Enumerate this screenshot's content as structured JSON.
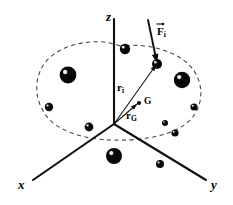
{
  "figure": {
    "background_color": "#ffffff",
    "ink_color": "#080808",
    "dashed_outline_color": "#444444",
    "width": 233,
    "height": 205
  },
  "axes": {
    "origin": {
      "x": 114,
      "y": 124
    },
    "items": [
      {
        "id": "z",
        "label": "z",
        "label_x": 106,
        "label_y": 10,
        "x1": 114,
        "y1": 124,
        "x2": 114,
        "y2": 19
      },
      {
        "id": "x",
        "label": "x",
        "label_x": 18,
        "label_y": 178,
        "x1": 114,
        "y1": 124,
        "x2": 33,
        "y2": 180
      },
      {
        "id": "y",
        "label": "y",
        "label_x": 211,
        "label_y": 178,
        "x1": 114,
        "y1": 124,
        "x2": 206,
        "y2": 180
      }
    ]
  },
  "vectors": [
    {
      "id": "r_i",
      "base": "r",
      "subscript": "i",
      "has_arrow_overbar": false,
      "label_x": 117,
      "label_y": 82,
      "x1": 114,
      "y1": 124,
      "x2": 156,
      "y2": 65,
      "description": "position vector from origin to particle i"
    },
    {
      "id": "r_G",
      "base": "r",
      "subscript": "G",
      "has_arrow_overbar": false,
      "label_x": 126,
      "label_y": 110,
      "x1": 114,
      "y1": 124,
      "x2": 137,
      "y2": 104,
      "description": "position vector from origin to center of mass G"
    },
    {
      "id": "F_i",
      "base": "F",
      "subscript": "i",
      "has_arrow_overbar": true,
      "label_x": 157,
      "label_y": 26,
      "x1": 148,
      "y1": 20,
      "x2": 157,
      "y2": 63,
      "description": "external force applied on particle i"
    }
  ],
  "points": [
    {
      "id": "G",
      "label": "G",
      "cx": 139,
      "cy": 103,
      "r": 2.0,
      "label_x": 144,
      "label_y": 97,
      "description": "center of mass"
    }
  ],
  "particles": [
    {
      "cx": 125,
      "cy": 49,
      "r": 5.2
    },
    {
      "cx": 68,
      "cy": 75,
      "r": 8.4
    },
    {
      "cx": 49,
      "cy": 107,
      "r": 4.2
    },
    {
      "cx": 89,
      "cy": 127,
      "r": 4.4
    },
    {
      "cx": 157,
      "cy": 64,
      "r": 5.0
    },
    {
      "cx": 182,
      "cy": 80,
      "r": 8.2
    },
    {
      "cx": 194,
      "cy": 107,
      "r": 3.6
    },
    {
      "cx": 165,
      "cy": 123,
      "r": 3.0
    },
    {
      "cx": 175,
      "cy": 133,
      "r": 3.6
    },
    {
      "cx": 114,
      "cy": 156,
      "r": 8.0
    },
    {
      "cx": 160,
      "cy": 164,
      "r": 4.0
    }
  ],
  "cloud_outline": {
    "path": "M 120 46 C 96 36 58 44 44 64 C 32 82 36 104 48 118 C 62 134 92 140 112 140 C 142 141 176 136 192 118 C 206 101 203 76 186 62 C 170 49 144 43 120 46 Z",
    "style": "dashed"
  }
}
